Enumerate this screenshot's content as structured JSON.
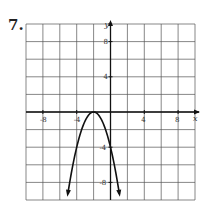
{
  "problem_number": "7.",
  "chart_data": {
    "type": "line",
    "title": "",
    "xlabel": "x",
    "ylabel": "y",
    "xlim": [
      -10,
      10
    ],
    "ylim": [
      -10,
      10
    ],
    "grid": true,
    "grid_step": 2,
    "x_ticks_labeled": [
      "-8",
      "-4",
      "4",
      "8"
    ],
    "y_ticks_labeled": [
      "8",
      "4",
      "-4",
      "-8"
    ],
    "series": [
      {
        "name": "parabola",
        "equation": "y = -(x+2)^2",
        "vertex": [
          -2,
          0
        ],
        "x": [
          -5,
          -4,
          -3,
          -2,
          -1,
          0,
          1
        ],
        "values": [
          -9,
          -4,
          -1,
          0,
          -1,
          -4,
          -9
        ],
        "arrows_at_ends": true
      }
    ],
    "legend": "none"
  }
}
